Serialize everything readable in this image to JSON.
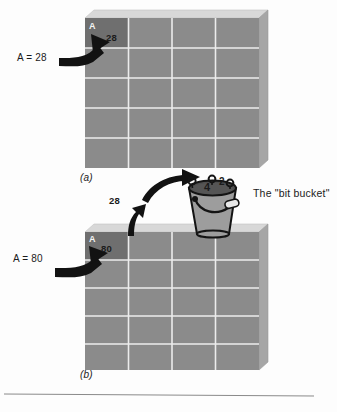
{
  "figure": {
    "caption_a": "(a)",
    "caption_b": "(b)",
    "bit_bucket_label": "The \"bit bucket\"",
    "colors": {
      "memory_cell": "#8b8b8b",
      "memory_cell_dark": "#6f6f6f",
      "grid_line": "#e9e9e9",
      "top_face": "#d6d6d6",
      "side_face": "#a9a9a9",
      "arrow": "#121212",
      "bucket_body": "#9a9a9a",
      "bucket_rim": "#4a4a4a",
      "text": "#1b1b1b",
      "rule": "#8a8a8a",
      "background": "#fdfdfd"
    }
  },
  "panel_a": {
    "id": "a",
    "caption": "(a)",
    "assignment_label": "A = 28",
    "variable_name": "A",
    "stored_value": "28",
    "grid": {
      "columns": 4,
      "rows": 5
    }
  },
  "panel_b": {
    "id": "b",
    "caption": "(b)",
    "assignment_label": "A = 80",
    "variable_name": "A",
    "stored_value": "80",
    "discarded_value": "28",
    "grid": {
      "columns": 4,
      "rows": 5
    }
  },
  "bit_bucket": {
    "label": "The \"bit bucket\"",
    "digits": [
      "4",
      "2"
    ],
    "bits": [
      "bit",
      "bit",
      "bit"
    ]
  }
}
